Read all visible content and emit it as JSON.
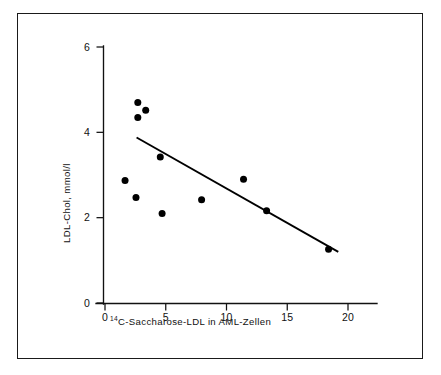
{
  "figure": {
    "frame_color": "#1a1a1a",
    "background": "#ffffff",
    "ink_color": "#000000"
  },
  "chart_data": {
    "type": "scatter",
    "title": "",
    "subtitle": "",
    "xlabel": "14C-Saccharose-LDL in AML-Zellen",
    "xlabel_superscript": "14",
    "xlabel_main": "C-Saccharose-LDL in AML-Zellen",
    "ylabel": "LDL-Chol, mmol/l",
    "xlim": [
      -0.6,
      22.5
    ],
    "ylim": [
      0,
      6
    ],
    "xticks": [
      0,
      5,
      10,
      15,
      20
    ],
    "xtick_labels": [
      "0",
      "5",
      "10",
      "15",
      "20"
    ],
    "yticks": [
      0,
      2,
      4,
      6
    ],
    "ytick_labels": [
      "0",
      "2",
      "4",
      "6"
    ],
    "grid": false,
    "legend": false,
    "legend_position": "none",
    "marker": "filled-circle",
    "marker_color": "#000000",
    "marker_size_px": 7,
    "points": [
      {
        "x": 2.7,
        "y": 4.7
      },
      {
        "x": 3.35,
        "y": 4.52
      },
      {
        "x": 2.7,
        "y": 4.35
      },
      {
        "x": 4.55,
        "y": 3.42
      },
      {
        "x": 1.65,
        "y": 2.87
      },
      {
        "x": 2.55,
        "y": 2.47
      },
      {
        "x": 4.7,
        "y": 2.1
      },
      {
        "x": 7.95,
        "y": 2.42
      },
      {
        "x": 11.4,
        "y": 2.9
      },
      {
        "x": 13.3,
        "y": 2.16
      },
      {
        "x": 18.4,
        "y": 1.26
      }
    ],
    "regression_line": {
      "type": "line",
      "x_start": 2.6,
      "y_start": 3.88,
      "x_end": 19.2,
      "y_end": 1.2,
      "color": "#000000"
    }
  }
}
